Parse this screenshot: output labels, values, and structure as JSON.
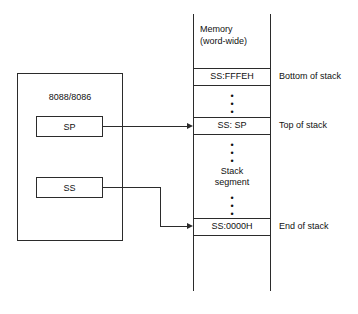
{
  "cpu": {
    "title": "8088/8086",
    "registers": [
      {
        "name": "SP",
        "label": "SP"
      },
      {
        "name": "SS",
        "label": "SS"
      }
    ]
  },
  "memory": {
    "header_line1": "Memory",
    "header_line2": "(word-wide)",
    "middle_label_line1": "Stack",
    "middle_label_line2": "segment",
    "cells": [
      {
        "value": "SS:FFFEH",
        "side_label": "Bottom of stack"
      },
      {
        "value": "SS: SP",
        "side_label": "Top of stack"
      },
      {
        "value": "SS:0000H",
        "side_label": "End of stack"
      }
    ],
    "ellipsis_glyph": "•"
  },
  "arrows": [
    {
      "name": "sp-pointer",
      "from": "SP",
      "to": "SS: SP"
    },
    {
      "name": "ss-pointer",
      "from": "SS",
      "to": "SS:0000H"
    }
  ],
  "colors": {
    "ink": "#2b2b2b",
    "text": "#111111",
    "background": "#ffffff"
  }
}
